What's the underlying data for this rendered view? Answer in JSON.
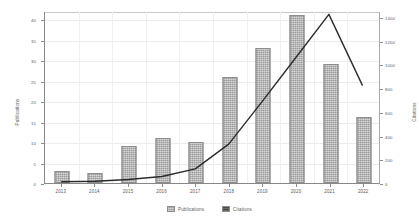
{
  "chart_data": {
    "type": "bar",
    "title": "",
    "xlabel": "",
    "ylabel": "Publications",
    "y2label": "Citations",
    "categories": [
      "2013",
      "2014",
      "2015",
      "2016",
      "2017",
      "2018",
      "2019",
      "2020",
      "2021",
      "2022"
    ],
    "ylim": [
      0,
      42
    ],
    "y2lim": [
      0,
      1450
    ],
    "yticks": [
      "0",
      "5",
      "10",
      "15",
      "20",
      "25",
      "30",
      "35",
      "40"
    ],
    "ytick_values": [
      0,
      5,
      10,
      15,
      20,
      25,
      30,
      35,
      40
    ],
    "y2ticks": [
      "0",
      "200",
      "400",
      "600",
      "800",
      "1000",
      "1200",
      "1400"
    ],
    "y2tick_values": [
      0,
      200,
      400,
      600,
      800,
      1000,
      1200,
      1400
    ],
    "grid": true,
    "legend_position": "bottom",
    "series": [
      {
        "name": "Publications",
        "chart_type": "bar",
        "axis": "left",
        "color": "#9a9a9a",
        "values": [
          3,
          2.5,
          9,
          11,
          10,
          26,
          33,
          41,
          29,
          16
        ]
      },
      {
        "name": "Citations",
        "chart_type": "line",
        "axis": "right",
        "color": "#2b2b2b",
        "values": [
          10,
          15,
          30,
          55,
          120,
          330,
          690,
          1060,
          1430,
          830
        ]
      }
    ]
  },
  "legend": {
    "items": [
      {
        "label": "Publications",
        "swatch": "pub"
      },
      {
        "label": "Citations",
        "swatch": "cit"
      }
    ]
  }
}
